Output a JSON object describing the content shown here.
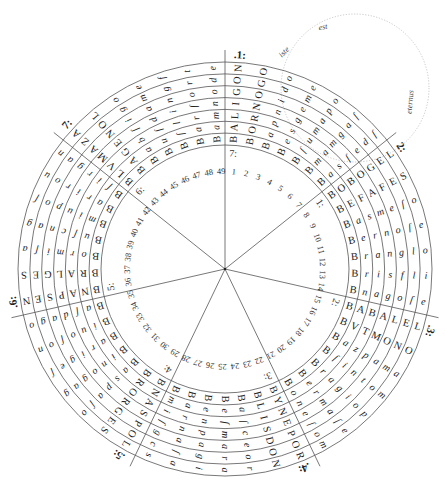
{
  "diagram": {
    "title_type": "volvelle",
    "sector_count": 7,
    "ring_count": 7,
    "sector_labels": [
      ".1:",
      "2:",
      ".3:",
      ".4:",
      ".5:",
      ".6:",
      "7:"
    ],
    "inner_labels": [
      "7:",
      "1:",
      "2:",
      "3:",
      "4:",
      "5:",
      "6:"
    ],
    "sectors": [
      {
        "label": ".1:",
        "words": [
          "BALIGON",
          "BORNOGO",
          "Bapnido",
          "Besgeme",
          "Bſumapo",
          "Bmamgaſ",
          "Basſedſ"
        ]
      },
      {
        "label": "2:",
        "words": [
          "BOBOGEL",
          "BEFAFES",
          "Basmeſo",
          "Bernoſe",
          "Branglo",
          "Brisfli",
          "Bnagoſe"
        ]
      },
      {
        "label": ".3:",
        "words": [
          "BABALEL",
          "BVTMONO",
          "Bazpama",
          "Bſintom",
          "Bragiop",
          "Bermaſe",
          "Boneſom"
        ]
      },
      {
        "label": ".4:",
        "words": [
          "BYNEPOR",
          "BLISDON",
          "Baſceor",
          "Beſmara",
          "Benpagi",
          "Barnaſa",
          "Bmiſgcs"
        ]
      },
      {
        "label": ".5:",
        "words": [
          "BNASPOL",
          "BRORGES",
          "Baspaſo",
          "Binogag",
          "Barigeſ",
          "Biuoſon",
          "Baſdago"
        ]
      },
      {
        "label": ".6:",
        "words": [
          "BNAPSEN",
          "BRALGES",
          "Bormiſa",
          "Buſcnag",
          "Bmiupoſ",
          "Barirou",
          "Bſirgan"
        ]
      },
      {
        "label": "7:",
        "words": [
          "BLVMAZA",
          "BAGENOL",
          "Babſigo",
          "Buſdame",
          "Bſlingf",
          "Barſort",
          "Bamnode"
        ]
      }
    ],
    "numbers": [
      "1",
      "2",
      "3",
      "4",
      "5",
      "6",
      "7",
      "8",
      "9",
      "10",
      "11",
      "12",
      "13",
      "14",
      "15",
      "16",
      "17",
      "18",
      "19",
      "20",
      "21",
      "22",
      "23",
      "24",
      "25",
      "26",
      "27",
      "28",
      "29",
      "30",
      "31",
      "32",
      "33",
      "34",
      "35",
      "36",
      "37",
      "38",
      "39",
      "40",
      "41",
      "42",
      "43",
      "44",
      "45",
      "46",
      "47",
      "48",
      "49"
    ],
    "small_circle": {
      "words": [
        "iste",
        "est",
        "eternus"
      ]
    },
    "colors": {
      "ink": "#222222",
      "line": "#555555",
      "dotted": "#bbbbbb",
      "background": "#ffffff"
    }
  }
}
